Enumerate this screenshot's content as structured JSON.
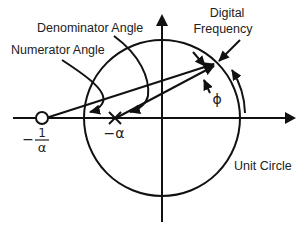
{
  "diagram": {
    "type": "pole-zero unit circle diagram",
    "labels": {
      "denominator_angle": "Denominator Angle",
      "numerator_angle": "Numerator Angle",
      "digital_frequency_line1": "Digital",
      "digital_frequency_line2": "Frequency",
      "phi": "ϕ",
      "unit_circle": "Unit Circle",
      "pole": "−α",
      "zero_minus": "−",
      "zero_numerator": "1",
      "zero_denominator": "α"
    },
    "markers": {
      "pole": {
        "symbol": "×",
        "label": "−α"
      },
      "zero": {
        "symbol": "○",
        "label": "−1/α"
      }
    },
    "colors": {
      "stroke": "#111111",
      "background": "#ffffff"
    }
  }
}
